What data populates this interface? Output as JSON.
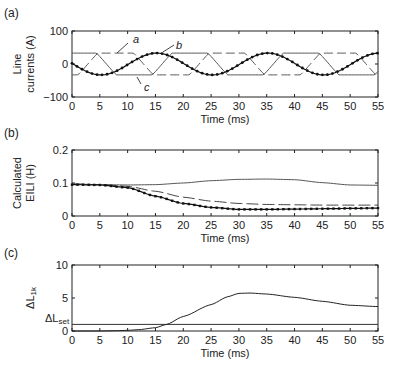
{
  "chart_data": [
    {
      "panel": "(a)",
      "type": "line",
      "xlabel": "Time (ms)",
      "ylabel_lines": [
        "Line",
        "currents (A)"
      ],
      "xlim": [
        0,
        55
      ],
      "ylim": [
        -100,
        100
      ],
      "xticks": [
        0,
        5,
        10,
        15,
        20,
        25,
        30,
        35,
        40,
        45,
        50,
        55
      ],
      "yticks": [
        100,
        0,
        -100
      ],
      "ytick_labels": [
        "100",
        "0",
        "−100"
      ],
      "series": [
        {
          "name": "a",
          "style": "dashed",
          "description": "clipped three-phase current, ~±33 A, period 20 ms"
        },
        {
          "name": "b",
          "style": "dotted-marker",
          "description": "sinusoidal current, amplitude ~33 A, period 20 ms; min at ~5 ms, max at ~15 ms"
        },
        {
          "name": "c",
          "style": "solid",
          "description": "clipped three-phase current, ~±33 A, period 20 ms"
        }
      ],
      "amplitude": 33,
      "period_ms": 20,
      "annotations": [
        {
          "text": "a",
          "x": 10.5,
          "y": 72
        },
        {
          "text": "b",
          "x": 18.5,
          "y": 58
        },
        {
          "text": "c",
          "x": 9.5,
          "y": -75
        }
      ]
    },
    {
      "panel": "(b)",
      "type": "line",
      "xlabel": "Time (ms)",
      "ylabel_lines": [
        "Calculated",
        "EILI (H)"
      ],
      "xlim": [
        0,
        55
      ],
      "ylim": [
        0,
        0.2
      ],
      "xticks": [
        0,
        5,
        10,
        15,
        20,
        25,
        30,
        35,
        40,
        45,
        50,
        55
      ],
      "yticks": [
        0.2,
        0.1,
        0
      ],
      "ytick_labels": [
        "0.2",
        "0.1",
        "0"
      ],
      "series": [
        {
          "name": "solid",
          "style": "solid",
          "x": [
            0,
            5,
            10,
            15,
            20,
            25,
            30,
            35,
            40,
            45,
            50,
            55
          ],
          "y": [
            0.097,
            0.095,
            0.094,
            0.095,
            0.1,
            0.107,
            0.111,
            0.112,
            0.11,
            0.101,
            0.094,
            0.093
          ]
        },
        {
          "name": "dashed",
          "style": "dashed",
          "x": [
            0,
            5,
            10,
            15,
            20,
            25,
            30,
            35,
            40,
            45,
            50,
            55
          ],
          "y": [
            0.097,
            0.095,
            0.09,
            0.075,
            0.057,
            0.045,
            0.038,
            0.035,
            0.034,
            0.033,
            0.033,
            0.033
          ]
        },
        {
          "name": "dotted",
          "style": "dotted-marker",
          "x": [
            0,
            5,
            10,
            15,
            20,
            25,
            30,
            35,
            40,
            45,
            50,
            55
          ],
          "y": [
            0.095,
            0.094,
            0.086,
            0.06,
            0.038,
            0.026,
            0.02,
            0.02,
            0.021,
            0.022,
            0.023,
            0.024
          ]
        }
      ]
    },
    {
      "panel": "(c)",
      "type": "line",
      "xlabel": "Time (ms)",
      "ylabel": "ΔL1k",
      "xlim": [
        0,
        55
      ],
      "ylim": [
        0,
        10
      ],
      "xticks": [
        0,
        5,
        10,
        15,
        20,
        25,
        30,
        35,
        40,
        45,
        50,
        55
      ],
      "yticks": [
        10,
        5,
        0
      ],
      "ytick_labels": [
        "10",
        "5",
        "0"
      ],
      "threshold": {
        "label": "ΔLset",
        "value": 1
      },
      "series": [
        {
          "name": "ΔL1k",
          "style": "solid",
          "x": [
            0,
            5,
            8,
            10,
            12,
            15,
            17,
            20,
            25,
            28,
            30,
            32,
            35,
            40,
            45,
            50,
            55
          ],
          "y": [
            0,
            0,
            0.05,
            0.1,
            0.2,
            0.5,
            1.0,
            2.2,
            4.0,
            5.2,
            5.7,
            5.75,
            5.6,
            5.1,
            4.5,
            3.9,
            3.7
          ]
        }
      ]
    }
  ],
  "labels": {
    "panel_a": "(a)",
    "panel_b": "(b)",
    "panel_c": "(c)",
    "xlabel": "Time (ms)",
    "a_ylabel_1": "Line",
    "a_ylabel_2": "currents (A)",
    "b_ylabel_1": "Calculated",
    "b_ylabel_2": "EILI (H)",
    "c_ylabel_main": "ΔL",
    "c_ylabel_sub": "1k",
    "c_set_main": "ΔL",
    "c_set_sub": "set",
    "ann_a": "a",
    "ann_b": "b",
    "ann_c": "c"
  },
  "colors": {
    "axis": "#222222",
    "series_gray": "#555555",
    "series_dark": "#111111"
  }
}
